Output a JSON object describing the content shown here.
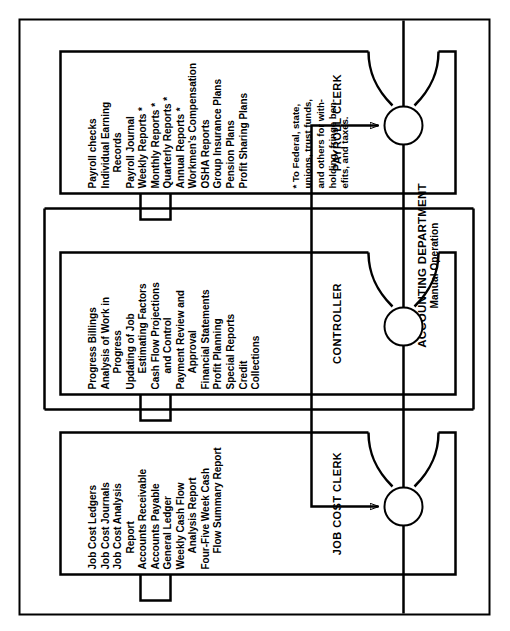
{
  "diagram": {
    "title": "ACCOUNTING DEPARTMENT",
    "subtitle": "Manual Operation",
    "type": "organizational-flow-diagram",
    "orientation": "rotated-90-ccw",
    "colors": {
      "line": "#000000",
      "background": "#ffffff",
      "text": "#000000"
    },
    "nodes": [
      {
        "id": "job-cost-clerk",
        "label": "JOB COST CLERK",
        "duties": [
          {
            "text": "Job Cost Ledgers",
            "indent": 0
          },
          {
            "text": "Job Cost Journals",
            "indent": 0
          },
          {
            "text": "Job Cost Analysis",
            "indent": 0
          },
          {
            "text": "Report",
            "indent": 1
          },
          {
            "text": "Accounts Receivable",
            "indent": 0
          },
          {
            "text": "Accounts Payable",
            "indent": 0
          },
          {
            "text": "General Ledger",
            "indent": 0
          },
          {
            "text": "Weekly Cash Flow",
            "indent": 0
          },
          {
            "text": "Analysis Report",
            "indent": 1
          },
          {
            "text": "Four-Five Week Cash",
            "indent": 0
          },
          {
            "text": "Flow Summary Report",
            "indent": 1
          }
        ]
      },
      {
        "id": "controller",
        "label": "CONTROLLER",
        "duties": [
          {
            "text": "Progress Billings",
            "indent": 0
          },
          {
            "text": "Analysis of Work in",
            "indent": 0
          },
          {
            "text": "Progress",
            "indent": 1
          },
          {
            "text": "Updating of Job",
            "indent": 0
          },
          {
            "text": "Estimating Factors",
            "indent": 1
          },
          {
            "text": "Cash Flow Projections",
            "indent": 0
          },
          {
            "text": "and Control",
            "indent": 1
          },
          {
            "text": "Payment Review and",
            "indent": 0
          },
          {
            "text": "Approval",
            "indent": 1
          },
          {
            "text": "Financial Statements",
            "indent": 0
          },
          {
            "text": "Profit Planning",
            "indent": 0
          },
          {
            "text": "Special Reports",
            "indent": 0
          },
          {
            "text": "Credit",
            "indent": 0
          },
          {
            "text": "Collections",
            "indent": 0
          }
        ]
      },
      {
        "id": "payroll-clerk",
        "label": "PAYROLL CLERK",
        "duties": [
          {
            "text": "Payroll checks",
            "indent": 0
          },
          {
            "text": "Individual Earning",
            "indent": 0
          },
          {
            "text": "Records",
            "indent": 1
          },
          {
            "text": "Payroll Journal",
            "indent": 0
          },
          {
            "text": "Weekly Reports *",
            "indent": 0
          },
          {
            "text": "Monthly Reports *",
            "indent": 0
          },
          {
            "text": "Quarterly Reports *",
            "indent": 0
          },
          {
            "text": "Annual Reports *",
            "indent": 0
          },
          {
            "text": "Workmen's Compensation",
            "indent": 0
          },
          {
            "text": "OSHA Reports",
            "indent": 0
          },
          {
            "text": "Group Insurance Plans",
            "indent": 0
          },
          {
            "text": "Pension Plans",
            "indent": 0
          },
          {
            "text": "Profit Sharing Plans",
            "indent": 0
          }
        ]
      }
    ],
    "footnote": [
      "* To Federal, state,",
      "unions, trust funds,",
      "and others for with-",
      "holding, fringe ben-",
      "efits, and taxes."
    ]
  }
}
